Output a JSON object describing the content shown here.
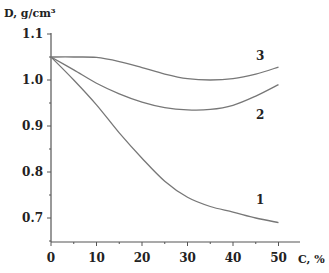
{
  "chart_data": {
    "type": "line",
    "title": "",
    "xlabel": "C, %",
    "ylabel": "D, g/cm³",
    "xlim": [
      0,
      52
    ],
    "ylim": [
      0.65,
      1.1
    ],
    "x_ticks": [
      0,
      10,
      20,
      30,
      40,
      50
    ],
    "x_tick_labels": [
      "0",
      "10",
      "20",
      "30",
      "40",
      "50"
    ],
    "y_ticks": [
      0.7,
      0.8,
      0.9,
      1.0,
      1.1
    ],
    "y_tick_labels": [
      "0.7",
      "0.8",
      "0.9",
      "1.0",
      "1.1"
    ],
    "grid": false,
    "legend": "inline labels",
    "x": [
      0,
      5,
      10,
      15,
      20,
      25,
      30,
      35,
      40,
      45,
      50
    ],
    "series": [
      {
        "name": "1",
        "values": [
          1.05,
          1.0,
          0.946,
          0.885,
          0.83,
          0.78,
          0.745,
          0.725,
          0.713,
          0.7,
          0.69
        ],
        "label_pos": [
          46,
          0.73
        ]
      },
      {
        "name": "2",
        "values": [
          1.05,
          1.022,
          0.993,
          0.97,
          0.952,
          0.94,
          0.935,
          0.936,
          0.945,
          0.965,
          0.99
        ],
        "label_pos": [
          46,
          0.915
        ]
      },
      {
        "name": "3",
        "values": [
          1.05,
          1.05,
          1.049,
          1.04,
          1.027,
          1.013,
          1.003,
          1.0,
          1.003,
          1.013,
          1.028
        ],
        "label_pos": [
          46,
          1.043
        ]
      }
    ]
  }
}
